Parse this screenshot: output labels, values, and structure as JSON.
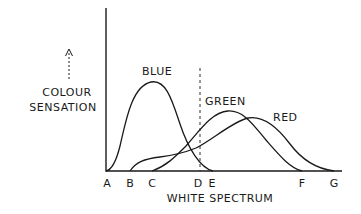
{
  "diagram": {
    "y_axis_label_line1": "COLOUR",
    "y_axis_label_line2": "SENSATION",
    "x_axis_label": "WHITE SPECTRUM",
    "ticks": [
      {
        "label": "A",
        "x": 107
      },
      {
        "label": "B",
        "x": 130
      },
      {
        "label": "C",
        "x": 152
      },
      {
        "label": "D",
        "x": 198
      },
      {
        "label": "E",
        "x": 212
      },
      {
        "label": "F",
        "x": 302
      },
      {
        "label": "G",
        "x": 334
      }
    ],
    "curves": [
      {
        "name": "BLUE",
        "label": "BLUE",
        "start": "A",
        "end": "E",
        "peak_x": 151
      },
      {
        "name": "GREEN",
        "label": "GREEN",
        "start": "C",
        "end": "F",
        "peak_x": 228
      },
      {
        "name": "RED",
        "label": "RED",
        "start": "B",
        "end": "G",
        "peak_x": 252
      }
    ],
    "reference_line": {
      "at": "D",
      "style": "dashed"
    },
    "colors": {
      "ink": "#1a1a1a",
      "background": "#ffffff"
    }
  }
}
